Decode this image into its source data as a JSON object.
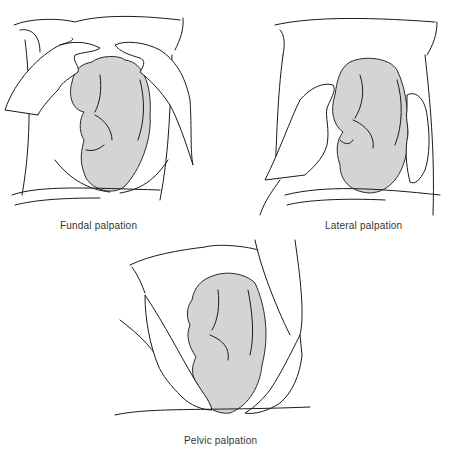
{
  "figure": {
    "panels": [
      {
        "id": "fundal",
        "caption": "Fundal palpation"
      },
      {
        "id": "lateral",
        "caption": "Lateral palpation"
      },
      {
        "id": "pelvic",
        "caption": "Pelvic palpation"
      }
    ],
    "colors": {
      "fetus_fill": "#d4d4d4",
      "line": "#1a1a1a",
      "background": "#ffffff",
      "caption_text": "#333333"
    }
  }
}
